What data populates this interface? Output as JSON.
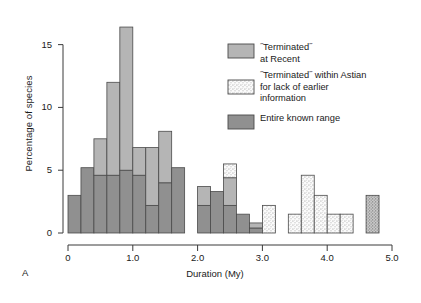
{
  "figure": {
    "panel_label": "A",
    "xlabel": "Duration (My)",
    "ylabel": "Percentage of species"
  },
  "legend": {
    "items": [
      {
        "id": "terminated-at-recent",
        "swatch": "solid-medium",
        "color": "#b0b0b0",
        "lines": [
          "˝Terminated˝",
          "at Recent"
        ]
      },
      {
        "id": "terminated-within-astian",
        "swatch": "stipple-light",
        "color": "#f2f2f2",
        "lines": [
          "˝Terminated˝ within Astian",
          "for lack of earlier",
          "information"
        ]
      },
      {
        "id": "entire-known-range",
        "swatch": "solid-dark",
        "color": "#8c8c8c",
        "lines": [
          "Entire known range"
        ]
      }
    ]
  },
  "chart_data": {
    "type": "bar",
    "subtype": "stacked-histogram",
    "title": "",
    "xlabel": "Duration (My)",
    "ylabel": "Percentage of species",
    "xlim": [
      0,
      5.0
    ],
    "ylim": [
      0,
      17.2
    ],
    "xticks": [
      0,
      1.0,
      2.0,
      3.0,
      4.0,
      5.0
    ],
    "xtick_labels": [
      "0",
      "1.0",
      "2.0",
      "3.0",
      "4.0",
      "5.0"
    ],
    "yticks": [
      0,
      5,
      10,
      15
    ],
    "ytick_labels": [
      "0",
      "5",
      "10",
      "15"
    ],
    "grid": false,
    "legend_position": "upper-right",
    "bin_width": 0.2,
    "bin_starts": [
      0.0,
      0.2,
      0.4,
      0.6,
      0.8,
      1.0,
      1.2,
      1.4,
      1.6,
      1.8,
      2.0,
      2.2,
      2.4,
      2.6,
      2.8,
      3.0,
      3.2,
      3.4,
      3.6,
      3.8,
      4.0,
      4.2,
      4.4,
      4.6
    ],
    "series": [
      {
        "name": "Entire known range",
        "fill": "solid-dark",
        "color": "#8c8c8c",
        "values": [
          3.0,
          5.2,
          4.6,
          4.6,
          5.0,
          4.6,
          2.2,
          4.0,
          5.2,
          0,
          2.2,
          3.3,
          2.2,
          1.5,
          0.4,
          0,
          0,
          0,
          0,
          0,
          0,
          0,
          0,
          0
        ]
      },
      {
        "name": "˝Terminated˝ at Recent",
        "fill": "solid-medium",
        "color": "#b0b0b0",
        "values": [
          0,
          0,
          2.9,
          7.4,
          11.4,
          2.2,
          4.6,
          4.1,
          0,
          0,
          1.5,
          0,
          2.2,
          0,
          0.4,
          0,
          0,
          0,
          0,
          0,
          0,
          0,
          0,
          0
        ]
      },
      {
        "name": "˝Terminated˝ within Astian for lack of earlier information",
        "fill": "stipple-light",
        "color": "#f2f2f2",
        "values": [
          0,
          0,
          0,
          0,
          0,
          0,
          0,
          0,
          0,
          0,
          0,
          0,
          1.1,
          0,
          0,
          2.2,
          0,
          1.5,
          4.6,
          3.0,
          1.5,
          1.5,
          0,
          0
        ]
      },
      {
        "name": "˝Terminated˝ within Astian (dark stipple)",
        "fill": "stipple-dark",
        "color": "#a8a8a8",
        "values": [
          0,
          0,
          0,
          0,
          0,
          0,
          0,
          0,
          0,
          0,
          0,
          0,
          0,
          0,
          0,
          0,
          0,
          0,
          0,
          0,
          0,
          0,
          0,
          3.0
        ]
      }
    ],
    "totals": [
      3.0,
      5.2,
      7.5,
      12.0,
      16.4,
      6.8,
      6.8,
      8.1,
      5.2,
      0,
      3.7,
      3.3,
      5.5,
      1.5,
      0.8,
      2.2,
      0,
      1.5,
      4.6,
      3.0,
      1.5,
      1.5,
      0,
      3.0
    ]
  }
}
